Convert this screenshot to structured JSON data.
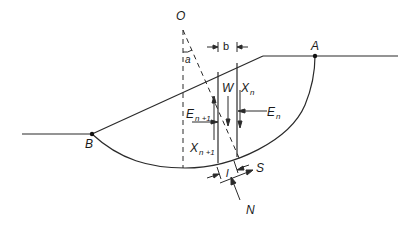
{
  "diagram": {
    "points": {
      "O": "O",
      "A": "A",
      "B": "B"
    },
    "angle_label": "a",
    "width_label": "b",
    "forces": {
      "W": "W",
      "Xn": {
        "base": "X",
        "sub": "n"
      },
      "En": {
        "base": "E",
        "sub": "n"
      },
      "En1": {
        "base": "E",
        "sub": "n +1"
      },
      "Xn1": {
        "base": "X",
        "sub": "n +1"
      },
      "S": "S",
      "N": "N"
    },
    "base_length_label": "l",
    "line_color": "#2a2a2a"
  }
}
